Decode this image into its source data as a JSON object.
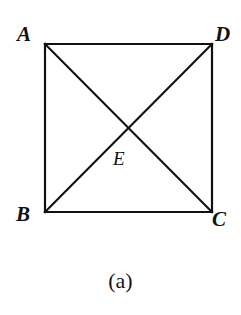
{
  "figure": {
    "caption": "(a)",
    "background_color": "#ffffff",
    "stroke_color": "#111111",
    "stroke_width": 2.2,
    "canvas": {
      "width": 241,
      "height": 315
    },
    "shape": {
      "type": "square-with-diagonals",
      "vertices": [
        {
          "name": "A",
          "label": "A",
          "x": 45,
          "y": 44,
          "corner": "top-left"
        },
        {
          "name": "D",
          "label": "D",
          "x": 212,
          "y": 44,
          "corner": "top-right"
        },
        {
          "name": "C",
          "label": "C",
          "x": 212,
          "y": 212,
          "corner": "bottom-right"
        },
        {
          "name": "B",
          "label": "B",
          "x": 45,
          "y": 212,
          "corner": "bottom-left"
        }
      ],
      "interior_points": [
        {
          "name": "E",
          "label": "E",
          "x": 128.5,
          "y": 128,
          "description": "diagonal intersection"
        }
      ],
      "edges": [
        {
          "from": "A",
          "to": "D"
        },
        {
          "from": "D",
          "to": "C"
        },
        {
          "from": "C",
          "to": "B"
        },
        {
          "from": "B",
          "to": "A"
        }
      ],
      "diagonals": [
        {
          "from": "A",
          "to": "C"
        },
        {
          "from": "B",
          "to": "D"
        }
      ]
    }
  }
}
